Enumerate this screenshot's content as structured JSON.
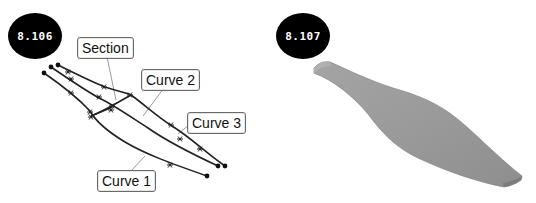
{
  "figures": [
    {
      "number": "8.106",
      "description": "Curve network for a loft",
      "callouts": {
        "section": "Section",
        "curve2": "Curve 2",
        "curve3": "Curve 3",
        "curve1": "Curve 1"
      }
    },
    {
      "number": "8.107",
      "description": "Resulting lofted surface"
    }
  ],
  "colors": {
    "badge_bg": "#000000",
    "badge_text": "#ffffff",
    "curve_stroke": "#222222",
    "leader_stroke": "#9a9a9a",
    "surface_fill": "#9c9c9c",
    "surface_edge": "#7a7a7a"
  }
}
